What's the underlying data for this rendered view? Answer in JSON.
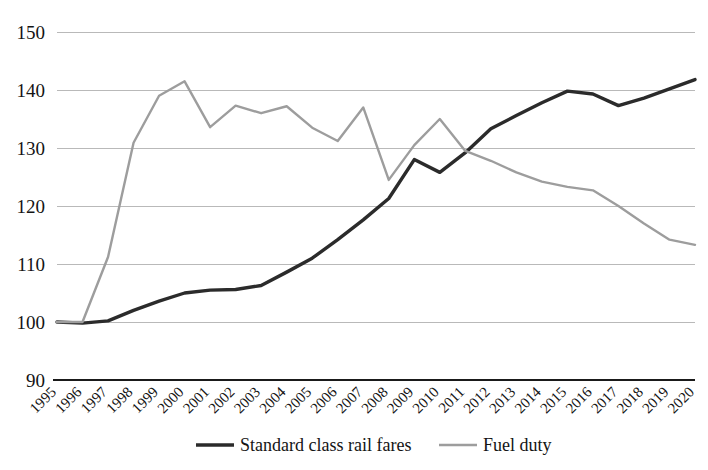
{
  "chart_data": {
    "type": "line",
    "title": "",
    "xlabel": "",
    "ylabel": "",
    "ylim": [
      90,
      150
    ],
    "grid": true,
    "legend_position": "bottom",
    "x": [
      1995,
      1996,
      1997,
      1998,
      1999,
      2000,
      2001,
      2002,
      2003,
      2004,
      2005,
      2006,
      2007,
      2008,
      2009,
      2010,
      2011,
      2012,
      2013,
      2014,
      2015,
      2016,
      2017,
      2018,
      2019,
      2020
    ],
    "categories": [
      "1995",
      "1996",
      "1997",
      "1998",
      "1999",
      "2000",
      "2001",
      "2002",
      "2003",
      "2004",
      "2005",
      "2006",
      "2007",
      "2008",
      "2009",
      "2010",
      "2011",
      "2012",
      "2013",
      "2014",
      "2015",
      "2016",
      "2017",
      "2018",
      "2019",
      "2020"
    ],
    "yticks": [
      90,
      100,
      110,
      120,
      130,
      140,
      150
    ],
    "ytick_labels": [
      "90",
      "100",
      "110",
      "120",
      "130",
      "140",
      "150"
    ],
    "series": [
      {
        "name": "Standard class rail fares",
        "color": "#2b2b2b",
        "width": 3.4,
        "values": [
          100.0,
          99.8,
          100.2,
          102.0,
          103.6,
          105.0,
          105.5,
          105.6,
          106.3,
          108.6,
          111.0,
          114.2,
          117.6,
          121.3,
          128.0,
          125.8,
          129.2,
          133.3,
          135.6,
          137.8,
          139.8,
          139.3,
          137.3,
          138.6,
          140.2,
          141.8
        ]
      },
      {
        "name": "Fuel duty",
        "color": "#9d9d9d",
        "width": 2.4,
        "values": [
          100.0,
          100.0,
          111.2,
          130.9,
          139.0,
          141.5,
          133.6,
          137.3,
          136.0,
          137.2,
          133.5,
          131.2,
          137.0,
          124.5,
          130.5,
          135.0,
          129.5,
          127.8,
          125.8,
          124.2,
          123.3,
          122.7,
          120.0,
          117.0,
          114.2,
          113.3
        ]
      }
    ]
  },
  "legend": {
    "items": [
      {
        "label": "Standard class rail fares",
        "color": "#2b2b2b",
        "width": 3.4
      },
      {
        "label": "Fuel duty",
        "color": "#9d9d9d",
        "width": 2.4
      }
    ]
  },
  "style": {
    "gridline_color": "#b9b9b9",
    "axis_color": "#1a1a1a",
    "background": "#ffffff"
  }
}
